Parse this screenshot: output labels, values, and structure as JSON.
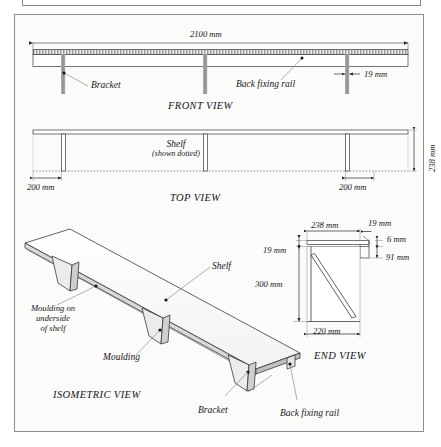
{
  "drawing": {
    "title": "Shelf assembly technical drawing",
    "background": "#fbfbfa",
    "line_color": "#3a3a3c",
    "bracket_fill": "#9a9a9a",
    "hatch_color": "#6d6d70"
  },
  "views": {
    "front": {
      "title": "FRONT VIEW",
      "labels": {
        "bracket": "Bracket",
        "back_fixing_rail": "Back fixing rail"
      },
      "dimensions": {
        "overall_length": "2100 mm",
        "bracket_thickness": "19 mm"
      }
    },
    "top": {
      "title": "TOP VIEW",
      "labels": {
        "shelf": "Shelf",
        "shelf_note": "(shown dotted)"
      },
      "dimensions": {
        "left_inset": "200 mm",
        "right_inset": "200 mm",
        "depth": "238 mm"
      }
    },
    "end": {
      "title": "END VIEW",
      "dimensions": {
        "shelf_depth": "238 mm",
        "rail_thickness_top": "19 mm",
        "shelf_thickness_left": "19 mm",
        "rail_height_small": "6 mm",
        "rail_height": "91 mm",
        "bracket_height": "300 mm",
        "bracket_depth": "220 mm"
      }
    },
    "isometric": {
      "title": "ISOMETRIC VIEW",
      "labels": {
        "shelf": "Shelf",
        "moulding_underside": "Moulding on\nunderside\nof shelf",
        "moulding_underside_line1": "Moulding on",
        "moulding_underside_line2": "underside",
        "moulding_underside_line3": "of shelf",
        "moulding": "Moulding",
        "bracket": "Bracket",
        "back_fixing_rail": "Back fixing rail"
      }
    }
  }
}
